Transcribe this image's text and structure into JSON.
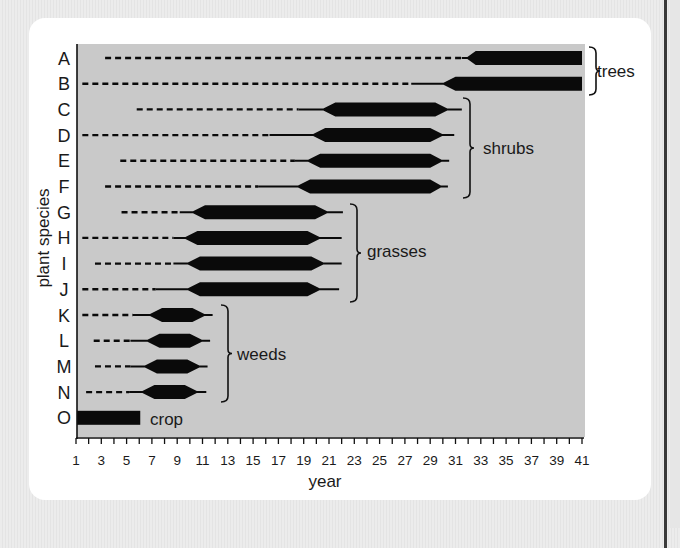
{
  "chart_data": {
    "type": "gantt-range",
    "title": "",
    "xlabel": "year",
    "ylabel": "plant species",
    "xlim": [
      1,
      41
    ],
    "x_ticks": [
      1,
      3,
      5,
      7,
      9,
      11,
      13,
      15,
      17,
      19,
      21,
      23,
      25,
      27,
      29,
      31,
      33,
      35,
      37,
      39,
      41
    ],
    "categories": [
      "A",
      "B",
      "C",
      "D",
      "E",
      "F",
      "G",
      "H",
      "I",
      "J",
      "K",
      "L",
      "M",
      "N",
      "O"
    ],
    "legend_note": "dashed = present as seed/rare; thin line = emerging/declining; thick bar = abundant",
    "series": [
      {
        "species": "A",
        "group": "trees",
        "dashed_start": 3.3,
        "dashed_end": 31.5,
        "thin_start": 31.5,
        "full_start": 32.6,
        "full_end": 41,
        "thin_end": 41
      },
      {
        "species": "B",
        "group": "trees",
        "dashed_start": 1.5,
        "dashed_end": 27.5,
        "thin_start": 27.5,
        "full_start": 31.0,
        "full_end": 41,
        "thin_end": 41
      },
      {
        "species": "C",
        "group": "shrubs",
        "dashed_start": 5.8,
        "dashed_end": 18.6,
        "thin_start": 18.6,
        "full_start": 21.5,
        "full_end": 29.4,
        "thin_end": 31.5
      },
      {
        "species": "D",
        "group": "shrubs",
        "dashed_start": 1.5,
        "dashed_end": 16.3,
        "thin_start": 16.3,
        "full_start": 20.7,
        "full_end": 29.0,
        "thin_end": 30.9
      },
      {
        "species": "E",
        "group": "shrubs",
        "dashed_start": 4.5,
        "dashed_end": 18.3,
        "thin_start": 18.3,
        "full_start": 20.3,
        "full_end": 29.0,
        "thin_end": 30.5
      },
      {
        "species": "F",
        "group": "shrubs",
        "dashed_start": 3.3,
        "dashed_end": 15.4,
        "thin_start": 15.4,
        "full_start": 19.5,
        "full_end": 29.0,
        "thin_end": 30.4
      },
      {
        "species": "G",
        "group": "grasses",
        "dashed_start": 4.6,
        "dashed_end": 9.2,
        "thin_start": 9.2,
        "full_start": 11.2,
        "full_end": 19.9,
        "thin_end": 22.1
      },
      {
        "species": "H",
        "group": "grasses",
        "dashed_start": 1.5,
        "dashed_end": 8.7,
        "thin_start": 8.7,
        "full_start": 10.6,
        "full_end": 19.3,
        "thin_end": 22.0
      },
      {
        "species": "I",
        "group": "grasses",
        "dashed_start": 2.5,
        "dashed_end": 8.7,
        "thin_start": 8.7,
        "full_start": 10.8,
        "full_end": 19.6,
        "thin_end": 22.0
      },
      {
        "species": "J",
        "group": "grasses",
        "dashed_start": 1.5,
        "dashed_end": 7.3,
        "thin_start": 7.3,
        "full_start": 10.8,
        "full_end": 19.3,
        "thin_end": 21.8
      },
      {
        "species": "K",
        "group": "weeds",
        "dashed_start": 1.5,
        "dashed_end": 5.5,
        "thin_start": 5.5,
        "full_start": 7.8,
        "full_end": 10.2,
        "thin_end": 11.8
      },
      {
        "species": "L",
        "group": "weeds",
        "dashed_start": 2.4,
        "dashed_end": 5.3,
        "thin_start": 5.3,
        "full_start": 7.6,
        "full_end": 10.0,
        "thin_end": 11.6
      },
      {
        "species": "M",
        "group": "weeds",
        "dashed_start": 2.5,
        "dashed_end": 5.3,
        "thin_start": 5.3,
        "full_start": 7.4,
        "full_end": 9.8,
        "thin_end": 11.4
      },
      {
        "species": "N",
        "group": "weeds",
        "dashed_start": 1.8,
        "dashed_end": 5.2,
        "thin_start": 5.2,
        "full_start": 7.2,
        "full_end": 9.6,
        "thin_end": 11.3
      },
      {
        "species": "O",
        "group": "crop",
        "dashed_start": null,
        "dashed_end": null,
        "thin_start": 1,
        "full_start": 1,
        "full_end": 6.0,
        "thin_end": 6.0
      }
    ],
    "groups": [
      {
        "label": "trees",
        "rows": [
          "A",
          "B"
        ]
      },
      {
        "label": "shrubs",
        "rows": [
          "C",
          "D",
          "E",
          "F"
        ]
      },
      {
        "label": "grasses",
        "rows": [
          "G",
          "H",
          "I",
          "J"
        ]
      },
      {
        "label": "weeds",
        "rows": [
          "K",
          "L",
          "M",
          "N"
        ]
      },
      {
        "label": "crop",
        "rows": [
          "O"
        ]
      }
    ],
    "grid": false,
    "colors": {
      "plot_bg": "#c9c9c9",
      "bar": "#0a0a0a",
      "card": "#ffffff",
      "page_bg": "#e8e8e8"
    }
  }
}
